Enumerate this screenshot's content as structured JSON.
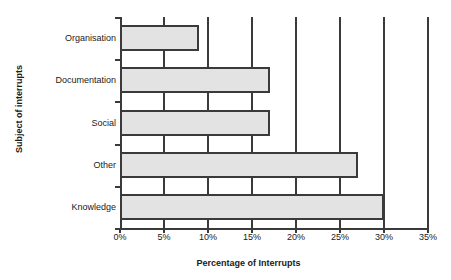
{
  "chart_data": {
    "type": "bar",
    "orientation": "horizontal",
    "title": "",
    "xlabel": "Percentage of Interrupts",
    "ylabel": "Subject of interrupts",
    "categories": [
      "Organisation",
      "Documentation",
      "Social",
      "Other",
      "Knowledge"
    ],
    "values": [
      9,
      17,
      17,
      27,
      30
    ],
    "xlim": [
      0,
      35
    ],
    "xtick_values": [
      0,
      5,
      10,
      15,
      20,
      25,
      30,
      35
    ],
    "xtick_labels": [
      "0%",
      "5%",
      "10%",
      "15%",
      "20%",
      "25%",
      "30%",
      "35%"
    ],
    "grid": "vertical",
    "legend": "none",
    "series": [
      {
        "name": "Percentage of Interrupts",
        "values": [
          9,
          17,
          17,
          27,
          30
        ]
      }
    ],
    "colors": {
      "bar_fill": "#e3e3e3",
      "bar_border": "#3a3a3a",
      "axis": "#3a3a3a",
      "grid": "#3a3a3a",
      "text": "#1a1a1a",
      "background": "#ffffff"
    }
  }
}
